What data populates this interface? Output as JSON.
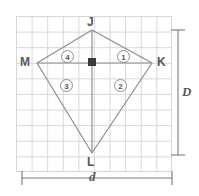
{
  "figure": {
    "type": "geometry-diagram",
    "shape_name": "kite",
    "background": "#ffffff",
    "grid": {
      "visible": true,
      "color": "#d7d7d7",
      "cell_px": 15.6,
      "cols": 10,
      "rows": 10,
      "origin_x": 16,
      "origin_y": 16,
      "width": 156,
      "height": 156
    },
    "stroke_color": "#8d8d90",
    "label_color": "#58585a",
    "marker_color": "#3a3a3c"
  },
  "vertices": [
    {
      "name": "J",
      "label": "J",
      "x": 92,
      "y": 30,
      "label_x": 87,
      "label_y": 16
    },
    {
      "name": "K",
      "label": "K",
      "x": 152,
      "y": 63,
      "label_x": 157,
      "label_y": 56
    },
    {
      "name": "L",
      "label": "L",
      "x": 92,
      "y": 153,
      "label_x": 87,
      "label_y": 156
    },
    {
      "name": "M",
      "label": "M",
      "x": 37,
      "y": 63,
      "label_x": 20,
      "label_y": 56
    }
  ],
  "edges": [
    {
      "name": "JK",
      "from": "J",
      "to": "K"
    },
    {
      "name": "KL",
      "from": "K",
      "to": "L"
    },
    {
      "name": "LM",
      "from": "L",
      "to": "M"
    },
    {
      "name": "MJ",
      "from": "M",
      "to": "J"
    }
  ],
  "diagonals": [
    {
      "name": "MK",
      "label": "D",
      "orientation": "horizontal",
      "from": "M",
      "to": "K"
    },
    {
      "name": "JL",
      "label": "d",
      "orientation": "vertical",
      "from": "J",
      "to": "L"
    }
  ],
  "angles": [
    {
      "id": "1",
      "label": "1",
      "quadrant": "upper-right",
      "x": 117,
      "y": 50
    },
    {
      "id": "2",
      "label": "2",
      "quadrant": "lower-right",
      "x": 114,
      "y": 79
    },
    {
      "id": "3",
      "label": "3",
      "quadrant": "lower-left",
      "x": 60,
      "y": 79
    },
    {
      "id": "4",
      "label": "4",
      "quadrant": "upper-left",
      "x": 61,
      "y": 50
    }
  ],
  "right_angle_marker": {
    "label": "right-angle",
    "x": 92,
    "y": 63,
    "size": 8
  },
  "measurements": [
    {
      "name": "vertical-measure",
      "label": "D",
      "orientation": "vertical",
      "axis_x": 178,
      "start": 30,
      "end": 155,
      "label_x": 182,
      "label_y": 85
    },
    {
      "name": "horizontal-measure",
      "label": "d",
      "orientation": "horizontal",
      "axis_y": 178,
      "start": 22,
      "end": 172,
      "label_x": 89,
      "label_y": 170
    }
  ]
}
